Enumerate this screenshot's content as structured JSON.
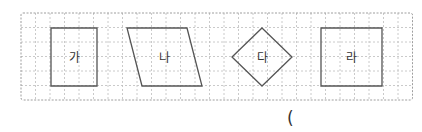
{
  "grid": {
    "x": 21,
    "y": 13,
    "cols": 27,
    "rows": 6,
    "cell": 14.5,
    "line_color": "#bdbdbd",
    "border_color": "#9e9e9e"
  },
  "shapes": [
    {
      "id": "ga",
      "label": "가",
      "type": "rectangle",
      "points": "51,28 97,28 97,86 51,86",
      "label_x": 74,
      "label_y": 62
    },
    {
      "id": "na",
      "label": "나",
      "type": "parallelogram",
      "points": "127,28 187,28 202,86 142,86",
      "label_x": 164,
      "label_y": 62
    },
    {
      "id": "da",
      "label": "다",
      "type": "rhombus",
      "points": "262,28 292,57 262,86 232,57",
      "label_x": 262,
      "label_y": 62
    },
    {
      "id": "ra",
      "label": "라",
      "type": "square",
      "points": "321,28 382,28 382,86 321,86",
      "label_x": 351,
      "label_y": 62
    }
  ],
  "shape_style": {
    "stroke": "#555555",
    "stroke_width": 1.3,
    "label_color": "#333333",
    "label_size": 12
  },
  "answer": {
    "open_paren": "("
  }
}
